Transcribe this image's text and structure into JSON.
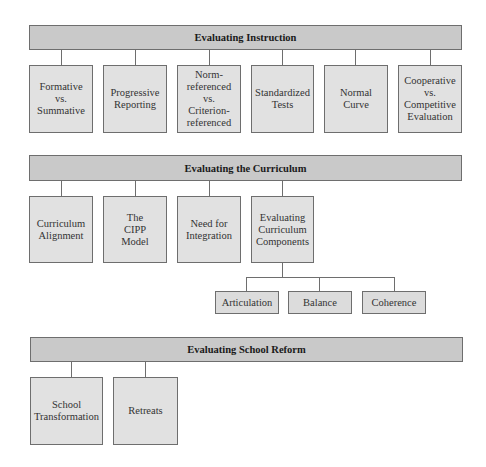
{
  "sections": [
    {
      "title": "Evaluating Instruction",
      "items": [
        "Formative\nvs.\nSummative",
        "Progressive\nReporting",
        "Norm-\nreferenced\nvs.\nCriterion-\nreferenced",
        "Standardized\nTests",
        "Normal\nCurve",
        "Cooperative\nvs.\nCompetitive\nEvaluation"
      ]
    },
    {
      "title": "Evaluating the Curriculum",
      "items": [
        "Curriculum\nAlignment",
        "The\nCIPP\nModel",
        "Need for\nIntegration",
        "Evaluating\nCurriculum\nComponents"
      ],
      "sub_items": [
        "Articulation",
        "Balance",
        "Coherence"
      ]
    },
    {
      "title": "Evaluating School Reform",
      "items": [
        "School\nTransformation",
        "Retreats"
      ]
    }
  ],
  "colors": {
    "header_fill": "#c9c9c9",
    "box_fill": "#e1e1e1",
    "border": "#6e6e6e"
  }
}
